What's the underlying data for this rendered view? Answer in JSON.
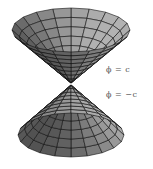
{
  "figure": {
    "labels": {
      "upper": "ϕ  =  c",
      "lower": "ϕ  =  −c"
    },
    "colors": {
      "face_light": "#b8b8b8",
      "face_mid": "#8e8e8e",
      "face_dark": "#5a5a5a",
      "edge": "#111111"
    }
  }
}
